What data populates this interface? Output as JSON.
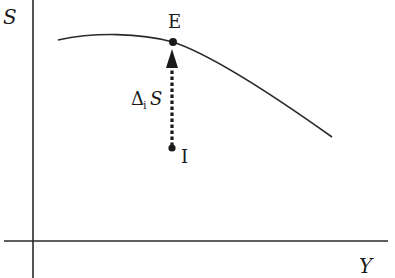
{
  "diagram": {
    "axes": {
      "y_label": "S",
      "x_label": "Y"
    },
    "points": {
      "equilibrium": {
        "label": "E"
      },
      "initial": {
        "label": "I"
      }
    },
    "arrow": {
      "label_delta": "Δ",
      "label_subscript": "i",
      "label_var": "S"
    },
    "colors": {
      "ink": "#1a1a1a",
      "background": "#ffffff"
    }
  }
}
